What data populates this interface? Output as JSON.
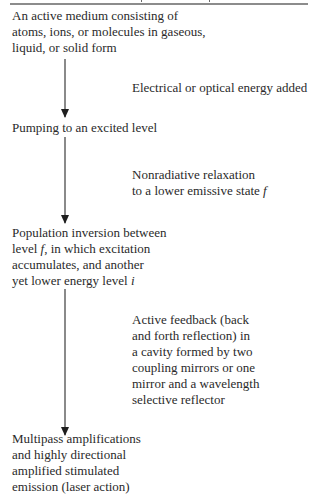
{
  "diagram": {
    "type": "vertical-flowchart",
    "header_rule": true,
    "steps": [
      {
        "id": "active-medium",
        "text": "An active medium consisting of\natoms, ions, or molecules in gaseous,\nliquid, or solid form"
      },
      {
        "id": "pumping",
        "text": "Pumping to an excited level"
      },
      {
        "id": "population-inversion",
        "text_lines": [
          "Population inversion between",
          "level ",
          "f",
          ", in which excitation",
          "accumulates, and another",
          "yet lower energy level ",
          "i"
        ]
      },
      {
        "id": "multipass",
        "text": "Multipass amplifications\nand highly directional\namplified stimulated\nemission (laser action)"
      }
    ],
    "transitions": [
      {
        "from": "active-medium",
        "to": "pumping",
        "label": "Electrical or optical energy added"
      },
      {
        "from": "pumping",
        "to": "population-inversion",
        "label_line1": "Nonradiative relaxation",
        "label_line2_prefix": "to a lower emissive state ",
        "label_var": "f"
      },
      {
        "from": "population-inversion",
        "to": "multipass",
        "label": "Active feedback (back\nand forth reflection) in\na cavity formed by two\ncoupling mirrors or one\nmirror and a wavelength\nselective reflector"
      }
    ],
    "colors": {
      "text": "#2a2a2a",
      "arrow_shaft": "#8a8a8a",
      "arrow_head": "#1e1e1e",
      "rule": "#8c8c8c"
    }
  }
}
